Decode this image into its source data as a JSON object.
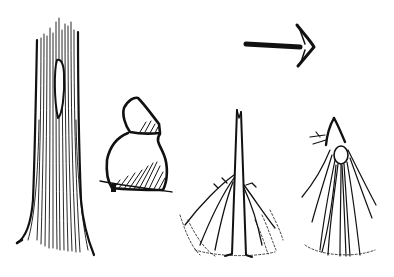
{
  "illustration": {
    "description": "Woodcut-style line drawing of trail markers",
    "background": "#ffffff",
    "ink_color": "#111111",
    "figures": [
      {
        "id": "blazed-tree",
        "label": "Tree trunk with blaze"
      },
      {
        "id": "stacked-stones",
        "label": "Stone cairn (two stacked stones)"
      },
      {
        "id": "grass-tuft-split",
        "label": "Tuft of grass with stem"
      },
      {
        "id": "grass-tuft-tied",
        "label": "Tuft of grass tied at top"
      },
      {
        "id": "direction-arrow",
        "label": "Arrow pointing right"
      }
    ]
  }
}
